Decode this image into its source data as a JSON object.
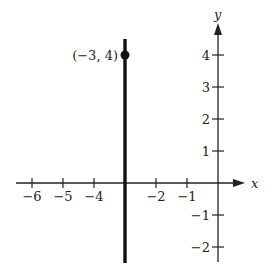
{
  "chart_data": {
    "type": "line",
    "title": "",
    "xlabel": "x",
    "ylabel": "y",
    "xlim": [
      -6.5,
      0.8
    ],
    "ylim": [
      -2.5,
      4.8
    ],
    "grid": false,
    "x_ticks": [
      -6,
      -5,
      -4,
      -2,
      -1
    ],
    "x_tick_labels": [
      "−6",
      "−5",
      "−4",
      "−2",
      "−1"
    ],
    "y_ticks": [
      4,
      3,
      2,
      1,
      -1,
      -2
    ],
    "y_tick_labels": [
      "4",
      "3",
      "2",
      "1",
      "−1",
      "−2"
    ],
    "series": [
      {
        "name": "vertical line x = -3",
        "x": [
          -3,
          -3
        ],
        "y": [
          4.5,
          -2.5
        ],
        "style": "thick solid"
      }
    ],
    "points": [
      {
        "x": -3,
        "y": 4,
        "label": "(−3, 4)",
        "marker": "filled-circle"
      }
    ],
    "annotations": [
      "(−3, 4)"
    ]
  }
}
